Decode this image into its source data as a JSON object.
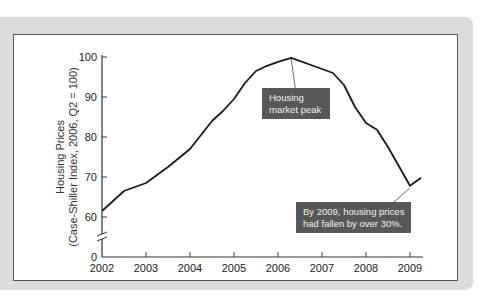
{
  "chart_data": {
    "type": "line",
    "title": "",
    "xlabel": "",
    "ylabel": "Housing Prices (Case-Shiller Index, 2006, Q2 = 100)",
    "ylabel_lines": [
      "Housing Prices",
      "(Case-Shiller Index, 2006, Q2 = 100)"
    ],
    "x_ticks": [
      "2002",
      "2003",
      "2004",
      "2005",
      "2006",
      "2007",
      "2008",
      "2009"
    ],
    "y_ticks": [
      "0",
      "60",
      "70",
      "80",
      "90",
      "100"
    ],
    "ylim": [
      0,
      100
    ],
    "y_axis_break": "between 0 and 60",
    "grid": false,
    "legend": null,
    "series": [
      {
        "name": "Housing Prices",
        "x": [
          2002.0,
          2002.5,
          2003.0,
          2003.5,
          2004.0,
          2004.25,
          2004.5,
          2004.75,
          2005.0,
          2005.25,
          2005.5,
          2005.75,
          2006.0,
          2006.3,
          2006.75,
          2007.0,
          2007.25,
          2007.5,
          2007.75,
          2008.0,
          2008.25,
          2008.5,
          2009.0,
          2009.25
        ],
        "values": [
          61.5,
          66.5,
          68.5,
          72.5,
          77,
          80.5,
          84,
          86.5,
          89.5,
          93.5,
          96.5,
          97.8,
          98.8,
          99.8,
          98,
          97,
          96,
          93,
          87.5,
          83.5,
          81.8,
          77.5,
          67.8,
          69.8
        ]
      }
    ],
    "annotations": [
      {
        "text_lines": [
          "Housing",
          "market peak"
        ],
        "points_to": {
          "x": 2006.3,
          "y": 99.8
        }
      },
      {
        "text_lines": [
          "By 2009, housing prices",
          "had fallen by over 30%."
        ],
        "points_to": {
          "x": 2009.0,
          "y": 67.8
        }
      }
    ]
  }
}
